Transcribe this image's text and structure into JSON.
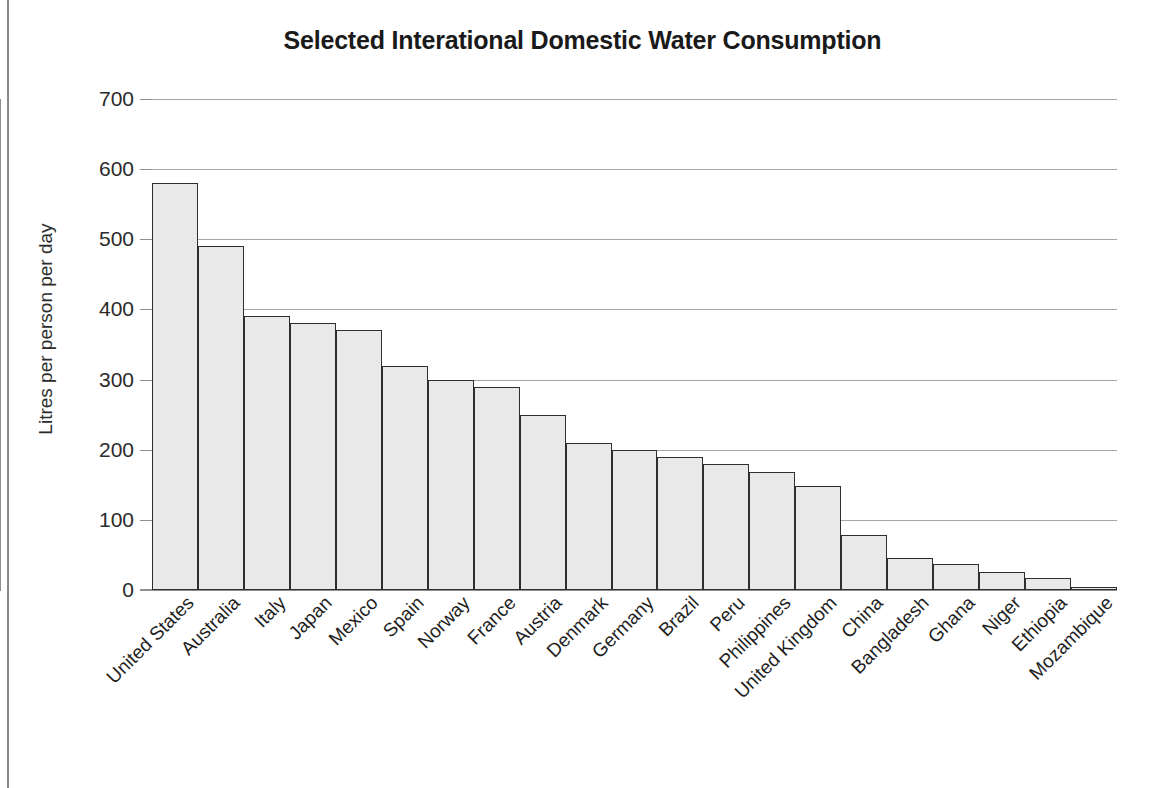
{
  "chart_data": {
    "type": "bar",
    "title": "Selected Interational Domestic Water Consumption",
    "xlabel": "",
    "ylabel": "Litres per person per day",
    "ylim": [
      0,
      700
    ],
    "ytick_step": 100,
    "yticks": [
      700,
      600,
      500,
      400,
      300,
      200,
      100,
      0
    ],
    "grid": true,
    "legend": null,
    "categories": [
      "United States",
      "Australia",
      "Italy",
      "Japan",
      "Mexico",
      "Spain",
      "Norway",
      "France",
      "Austria",
      "Denmark",
      "Germany",
      "Brazil",
      "Peru",
      "Philippines",
      "United Kingdom",
      "China",
      "Bangladesh",
      "Ghana",
      "Niger",
      "Ethiopia",
      "Mozambique"
    ],
    "values": [
      580,
      490,
      390,
      380,
      370,
      320,
      300,
      290,
      250,
      210,
      200,
      190,
      180,
      168,
      148,
      78,
      46,
      37,
      26,
      17,
      5
    ],
    "bar_fill_color": "#e9e9e9",
    "bar_edge_color": "#2e2e2e",
    "gridline_color": "#a6a6a6",
    "axis_color": "#8f8f8f"
  }
}
